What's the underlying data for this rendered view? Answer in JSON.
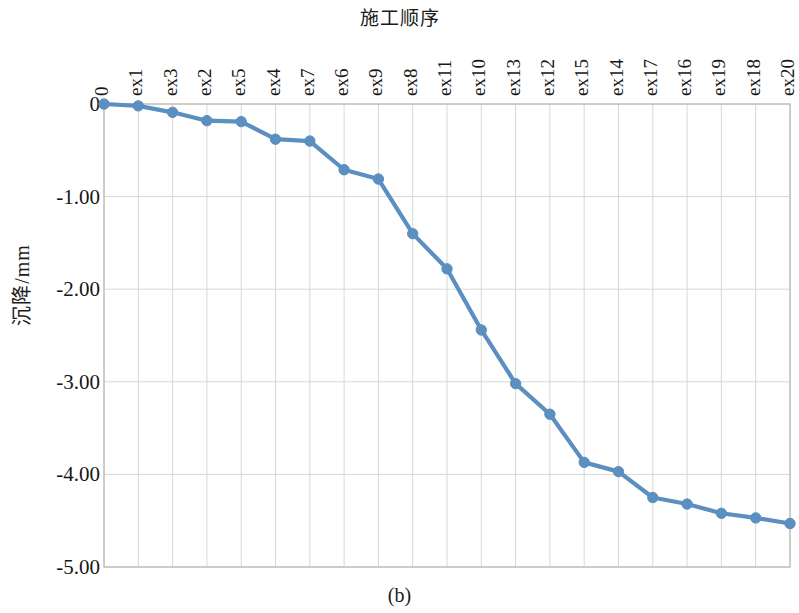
{
  "figure": {
    "caption": "(b)",
    "title": "施工顺序"
  },
  "axes": {
    "y_title": "沉降/mm",
    "y_ticks": [
      "0",
      "-1.00",
      "-2.00",
      "-3.00",
      "-4.00",
      "-5.00"
    ],
    "x_ticks": [
      "0",
      "ex1",
      "ex3",
      "ex2",
      "ex5",
      "ex4",
      "ex7",
      "ex6",
      "ex9",
      "ex8",
      "ex11",
      "ex10",
      "ex13",
      "ex12",
      "ex15",
      "ex14",
      "ex17",
      "ex16",
      "ex19",
      "ex18",
      "ex20"
    ]
  },
  "style": {
    "series_color": "#5b8fc0",
    "marker_color": "#5b8fc0",
    "grid_color": "#d8d8d2",
    "axis_color": "#b9b9b2",
    "background": "#ffffff"
  },
  "chart_data": {
    "type": "line",
    "title": "施工顺序",
    "xlabel": "施工顺序",
    "ylabel": "沉降/mm",
    "ylim": [
      -5.0,
      0.0
    ],
    "yticks": [
      0,
      -1.0,
      -2.0,
      -3.0,
      -4.0,
      -5.0
    ],
    "grid": true,
    "legend": null,
    "categories": [
      "0",
      "ex1",
      "ex3",
      "ex2",
      "ex5",
      "ex4",
      "ex7",
      "ex6",
      "ex9",
      "ex8",
      "ex11",
      "ex10",
      "ex13",
      "ex12",
      "ex15",
      "ex14",
      "ex17",
      "ex16",
      "ex19",
      "ex18",
      "ex20"
    ],
    "values": [
      0.0,
      -0.02,
      -0.09,
      -0.18,
      -0.19,
      -0.38,
      -0.4,
      -0.71,
      -0.81,
      -1.4,
      -1.78,
      -2.44,
      -3.02,
      -3.35,
      -3.87,
      -3.97,
      -4.25,
      -4.32,
      -4.42,
      -4.47,
      -4.53
    ],
    "series": [
      {
        "name": "沉降",
        "values": [
          0.0,
          -0.02,
          -0.09,
          -0.18,
          -0.19,
          -0.38,
          -0.4,
          -0.71,
          -0.81,
          -1.4,
          -1.78,
          -2.44,
          -3.02,
          -3.35,
          -3.87,
          -3.97,
          -4.25,
          -4.32,
          -4.42,
          -4.47,
          -4.53
        ]
      }
    ]
  },
  "plot_geometry": {
    "left": 104,
    "right": 790,
    "top": 104,
    "bottom": 567
  }
}
